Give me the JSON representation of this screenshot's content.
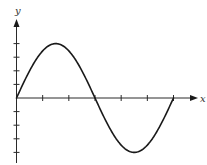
{
  "chart_data": {
    "type": "line",
    "title": "",
    "xlabel": "x",
    "ylabel": "y",
    "function": "y = 4 sin(x)",
    "x_range": [
      0,
      6.2832
    ],
    "y_range": [
      -4,
      4
    ],
    "x_ticks_count": 6,
    "y_ticks_count_each_side": 4,
    "grid": false,
    "legend": null,
    "series": [
      {
        "name": "sine curve",
        "x": [
          0,
          1.0472,
          1.5708,
          2.0944,
          3.1416,
          4.1888,
          4.7124,
          5.236,
          6.2832
        ],
        "y": [
          0,
          3.46,
          4,
          3.46,
          0,
          -3.46,
          -4,
          -3.46,
          0
        ]
      }
    ]
  },
  "labels": {
    "x_axis": "x",
    "y_axis": "y"
  },
  "style": {
    "line_color": "#1a1a1a",
    "axis_color": "#2a2a2a",
    "background": "#ffffff"
  }
}
